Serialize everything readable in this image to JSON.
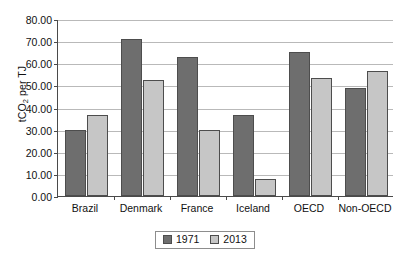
{
  "chart_data": {
    "type": "bar",
    "title": "",
    "xlabel": "",
    "ylabel": "tCO2 per TJ",
    "ylabel_parts": {
      "pre": "tCO",
      "sub": "2",
      "post": " per TJ"
    },
    "categories": [
      "Brazil",
      "Denmark",
      "France",
      "Iceland",
      "OECD",
      "Non-OECD"
    ],
    "series": [
      {
        "name": "1971",
        "color": "#6e6e6e",
        "values": [
          30.0,
          71.0,
          63.0,
          36.5,
          65.0,
          49.0
        ]
      },
      {
        "name": "2013",
        "color": "#c6c6c6",
        "values": [
          36.5,
          52.5,
          29.8,
          7.5,
          53.5,
          56.5
        ]
      }
    ],
    "ylim": [
      0,
      80
    ],
    "ytick_step": 10,
    "ytick_labels": [
      "80.00",
      "70.00",
      "60.00",
      "50.00",
      "40.00",
      "30.00",
      "20.00",
      "10.00",
      "0.00"
    ],
    "ytick_values": [
      80,
      70,
      60,
      50,
      40,
      30,
      20,
      10,
      0
    ],
    "grid": true,
    "legend_position": "bottom-center"
  }
}
